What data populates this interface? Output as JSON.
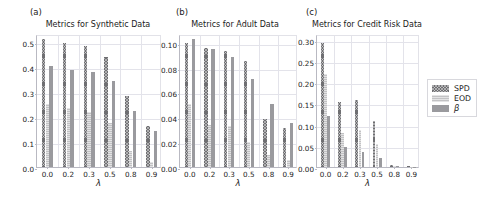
{
  "figure": {
    "panel_tags": [
      "(a)",
      "(b)",
      "(c)"
    ],
    "xlabel": "λ",
    "legend": {
      "entries": [
        {
          "label": "SPD",
          "color": "#6f6f72",
          "pattern": "cross-hatch"
        },
        {
          "label": "EOD",
          "color": "#c2c2c4",
          "pattern": "horizontal-hatch"
        },
        {
          "label": "β",
          "color": "#9a9a9e",
          "pattern": "solid"
        }
      ],
      "position": "right-outside"
    }
  },
  "chart_data": [
    {
      "type": "bar",
      "panel": "(a)",
      "title": "Metrics for Synthetic Data",
      "xlabel": "λ",
      "ylabel": "",
      "categories": [
        "0.0",
        "0.2",
        "0.3",
        "0.5",
        "0.8",
        "0.9"
      ],
      "yticks": [
        "0.0",
        "0.1",
        "0.2",
        "0.3",
        "0.4",
        "0.5"
      ],
      "ylim": [
        0.0,
        0.53
      ],
      "grid": true,
      "series": [
        {
          "name": "SPD",
          "values": [
            0.512,
            0.495,
            0.483,
            0.44,
            0.283,
            0.165
          ]
        },
        {
          "name": "EOD",
          "values": [
            0.252,
            0.236,
            0.218,
            0.177,
            0.065,
            0.019
          ]
        },
        {
          "name": "β",
          "values": [
            0.402,
            0.387,
            0.377,
            0.343,
            0.224,
            0.143
          ]
        }
      ]
    },
    {
      "type": "bar",
      "panel": "(b)",
      "title": "Metrics for Adult Data",
      "xlabel": "λ",
      "ylabel": "",
      "categories": [
        "0.0",
        "0.2",
        "0.3",
        "0.5",
        "0.8",
        "0.9"
      ],
      "yticks": [
        "0.00",
        "0.02",
        "0.04",
        "0.06",
        "0.08",
        "0.10"
      ],
      "ylim": [
        0.0,
        0.107
      ],
      "grid": true,
      "series": [
        {
          "name": "SPD",
          "values": [
            0.1,
            0.0958,
            0.093,
            0.085,
            0.039,
            0.031
          ]
        },
        {
          "name": "EOD",
          "values": [
            0.0508,
            0.0338,
            0.033,
            0.02,
            0.0098,
            0.0058
          ]
        },
        {
          "name": "β",
          "values": [
            0.1026,
            0.0948,
            0.0888,
            0.0712,
            0.0508,
            0.0358
          ]
        }
      ]
    },
    {
      "type": "bar",
      "panel": "(c)",
      "title": "Metrics for Credit Risk Data",
      "xlabel": "λ",
      "ylabel": "",
      "categories": [
        "0.0",
        "0.2",
        "0.3",
        "0.5",
        "0.8",
        "0.9"
      ],
      "yticks": [
        "0.00",
        "0.05",
        "0.10",
        "0.15",
        "0.20",
        "0.25",
        "0.30"
      ],
      "ylim": [
        0.0,
        0.313
      ],
      "grid": true,
      "series": [
        {
          "name": "SPD",
          "values": [
            0.292,
            0.152,
            0.157,
            0.108,
            0.004,
            0.002
          ]
        },
        {
          "name": "EOD",
          "values": [
            0.218,
            0.08,
            0.088,
            0.053,
            0.003,
            0.001
          ]
        },
        {
          "name": "β",
          "values": [
            0.12,
            0.047,
            0.035,
            0.022,
            0.003,
            0.001
          ]
        }
      ]
    }
  ]
}
